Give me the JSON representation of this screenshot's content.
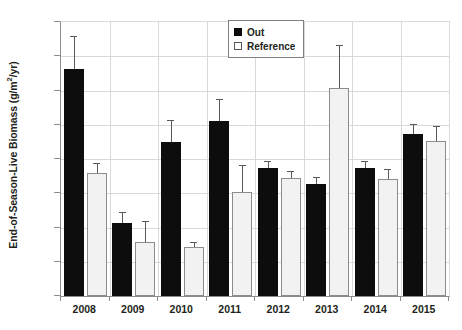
{
  "chart_data": {
    "type": "bar",
    "title": "",
    "xlabel": "",
    "ylabel": "End-of-Season-Live Biomass (g/m²/yr)",
    "ylabel_main": "End-of-Season-Live Biomass (g/m",
    "ylabel_sup": "2",
    "ylabel_tail": "/yr)",
    "categories": [
      "2008",
      "2009",
      "2010",
      "2011",
      "2012",
      "2013",
      "2014",
      "2015"
    ],
    "ylim": [
      0,
      1600
    ],
    "ytick_step": 200,
    "yticks": [
      0,
      200,
      400,
      600,
      800,
      1000,
      1200,
      1400,
      1600
    ],
    "ytick_labels": [
      "0",
      "200",
      "400",
      "600",
      "800",
      "1000",
      "1200",
      "1400",
      "1600"
    ],
    "grid": true,
    "grid_axis": "y",
    "legend_position": "top-center",
    "series": [
      {
        "name": "Out",
        "color": "#0d0d0d",
        "values": [
          1325,
          425,
          900,
          1020,
          750,
          655,
          745,
          945
        ],
        "errors": [
          185,
          60,
          120,
          125,
          35,
          35,
          40,
          55
        ]
      },
      {
        "name": "Reference",
        "color": "#f2f2f2",
        "values": [
          720,
          315,
          285,
          610,
          690,
          1215,
          685,
          905
        ],
        "errors": [
          50,
          120,
          25,
          150,
          35,
          245,
          50,
          80
        ]
      }
    ]
  },
  "legend": {
    "items": [
      {
        "label": "Out",
        "swatch": "filled-black-square"
      },
      {
        "label": "Reference",
        "swatch": "open-white-square"
      }
    ]
  },
  "colors": {
    "out_bar": "#0d0d0d",
    "reference_bar": "#f2f2f2",
    "reference_border": "#8c8c8c",
    "gridline": "#d9d9d9",
    "axis": "#8c8c8c",
    "text": "#231f20",
    "error_bar": "#595959",
    "background": "#ffffff"
  }
}
